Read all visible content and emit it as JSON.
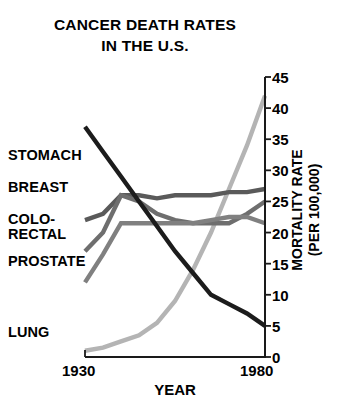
{
  "chart_data": {
    "type": "line",
    "title": "CANCER DEATH RATES IN THE U.S.",
    "title_lines": [
      "CANCER DEATH RATES",
      "IN THE U.S."
    ],
    "xlabel": "YEAR",
    "ylabel": "MORTALITY RATE (PER 100,000)",
    "ylabel_lines": [
      "MORTALITY RATE",
      "(PER 100,000)"
    ],
    "xlim": [
      1930,
      1980
    ],
    "ylim": [
      0,
      45
    ],
    "xticks": [
      1930,
      1980
    ],
    "xtick_labels": [
      "1930",
      "1980"
    ],
    "yticks": [
      0,
      5,
      10,
      15,
      20,
      25,
      30,
      35,
      40,
      45
    ],
    "ytick_labels": [
      "0",
      "5",
      "10",
      "15",
      "20",
      "25",
      "30",
      "35",
      "40",
      "45"
    ],
    "grid": false,
    "legend": "inline-left-labels",
    "y_axis_position": "right",
    "series": [
      {
        "name": "LUNG",
        "label_lines": [
          "LUNG"
        ],
        "color": "#b4b4b4",
        "x": [
          1930,
          1935,
          1940,
          1945,
          1950,
          1955,
          1960,
          1965,
          1970,
          1975,
          1980
        ],
        "values": [
          1,
          1.5,
          2.5,
          3.5,
          5.5,
          9,
          14,
          20,
          27,
          34,
          42
        ]
      },
      {
        "name": "BREAST",
        "label_lines": [
          "BREAST"
        ],
        "color": "#5a5a5a",
        "x": [
          1930,
          1935,
          1940,
          1945,
          1950,
          1955,
          1960,
          1965,
          1970,
          1975,
          1980
        ],
        "values": [
          22,
          23,
          26,
          26,
          25.5,
          26,
          26,
          26,
          26.5,
          26.5,
          27
        ]
      },
      {
        "name": "COLO-RECTAL",
        "label_lines": [
          "COLO-",
          "RECTAL"
        ],
        "color": "#6e6e6e",
        "x": [
          1930,
          1935,
          1940,
          1945,
          1950,
          1955,
          1960,
          1965,
          1970,
          1975,
          1980
        ],
        "values": [
          17,
          20,
          26,
          25,
          23,
          22,
          21.5,
          21.5,
          21.5,
          23,
          25
        ]
      },
      {
        "name": "PROSTATE",
        "label_lines": [
          "PROSTATE"
        ],
        "color": "#808080",
        "x": [
          1930,
          1935,
          1940,
          1945,
          1950,
          1955,
          1960,
          1965,
          1970,
          1975,
          1980
        ],
        "values": [
          12,
          16.5,
          21.5,
          21.5,
          21.5,
          21.5,
          21.5,
          22,
          22.5,
          22.5,
          21.5
        ]
      },
      {
        "name": "STOMACH",
        "label_lines": [
          "STOMACH"
        ],
        "color": "#1c1c1c",
        "x": [
          1930,
          1935,
          1940,
          1945,
          1950,
          1955,
          1960,
          1965,
          1970,
          1975,
          1980
        ],
        "values": [
          37,
          33,
          29,
          25,
          21,
          17,
          13.5,
          10,
          8.5,
          7,
          5
        ]
      }
    ]
  },
  "labels": {
    "stomach": "STOMACH",
    "breast": "BREAST",
    "colorectal_1": "COLO-",
    "colorectal_2": "RECTAL",
    "prostate": "PROSTATE",
    "lung": "LUNG"
  },
  "axes": {
    "x_min_label": "1930",
    "x_max_label": "1980",
    "x_title": "YEAR",
    "y_title_1": "MORTALITY RATE",
    "y_title_2": "(PER 100,000)",
    "y_0": "0",
    "y_5": "5",
    "y_10": "10",
    "y_15": "15",
    "y_20": "20",
    "y_25": "25",
    "y_30": "30",
    "y_35": "35",
    "y_40": "40",
    "y_45": "45"
  },
  "title": {
    "line1": "CANCER DEATH RATES",
    "line2": "IN THE U.S."
  }
}
